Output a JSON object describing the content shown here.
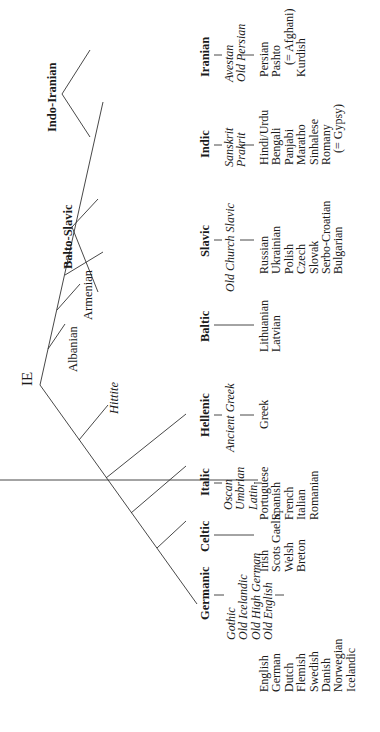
{
  "root": {
    "label": "IE"
  },
  "isolates": {
    "hittite": "Hittite",
    "albanian": "Albanian",
    "armenian": "Armenian"
  },
  "intermediate": {
    "balto_slavic": "Balto-Slavic",
    "indo_iranian": "Indo-Iranian"
  },
  "branches": [
    {
      "name": "Germanic",
      "ancient": [
        "Gothic",
        "Old Icelandic",
        "Old High German",
        "Old English"
      ],
      "modern": [
        "English",
        "German",
        "Dutch",
        "Flemish",
        "Swedish",
        "Danish",
        "Norwegian",
        "Icelandic"
      ]
    },
    {
      "name": "Celtic",
      "ancient": [],
      "modern": [
        "Irish",
        "Scots Gaelic",
        "Welsh",
        "Breton"
      ]
    },
    {
      "name": "Italic",
      "ancient": [
        "Oscan",
        "Umbrian",
        "Latin"
      ],
      "modern": [
        "Portuguese",
        "Spanish",
        "French",
        "Italian",
        "Romanian"
      ]
    },
    {
      "name": "Hellenic",
      "ancient": [
        "Ancient Greek"
      ],
      "modern": [
        "Greek"
      ]
    },
    {
      "name": "Baltic",
      "ancient": [],
      "modern": [
        "Lithuanian",
        "Latvian"
      ]
    },
    {
      "name": "Slavic",
      "ancient": [
        "Old Church Slavic"
      ],
      "modern": [
        "Russian",
        "Ukrainian",
        "Polish",
        "Czech",
        "Slovak",
        "Serbo-Croatian",
        "Bulgarian"
      ]
    },
    {
      "name": "Indic",
      "ancient": [
        "Sanskrit",
        "Prakrit"
      ],
      "modern": [
        "Hindi/Urdu",
        "Bengali",
        "Panjabi",
        "Maratho",
        "Sinhalese",
        "Romany",
        "(= Gypsy)"
      ]
    },
    {
      "name": "Iranian",
      "ancient": [
        "Avestan",
        "Old Persian"
      ],
      "modern": [
        "Persian",
        "Pashto",
        "(= Afghani)",
        "Kurdish"
      ]
    }
  ],
  "colors": {
    "line": "#333333",
    "text": "#1a1a1a",
    "background": "#ffffff"
  }
}
